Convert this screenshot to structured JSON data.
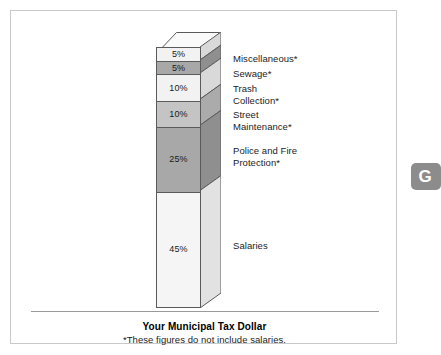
{
  "figure": {
    "caption_title": "Your Municipal Tax Dollar",
    "caption_note": "*These figures do not include salaries."
  },
  "badge": {
    "letter": "G"
  },
  "chart_data": {
    "type": "bar",
    "orientation": "vertical-stacked-3d",
    "title": "Your Municipal Tax Dollar",
    "subtitle": "*These figures do not include salaries.",
    "xlabel": "",
    "ylabel": "",
    "unit": "percent",
    "total": 100,
    "grid": false,
    "legend_position": "right-inline",
    "categories": [
      "Miscellaneous*",
      "Sewage*",
      "Trash Collection*",
      "Street Maintenance*",
      "Police and Fire Protection*",
      "Salaries"
    ],
    "values": [
      5,
      5,
      10,
      10,
      25,
      45
    ],
    "value_labels": [
      "5%",
      "5%",
      "10%",
      "10%",
      "25%",
      "45%"
    ],
    "segments": [
      {
        "label": "Miscellaneous*",
        "label_lines": "Miscellaneous*",
        "value": 5,
        "value_label": "5%",
        "face_color": "#f2f2f2",
        "side_color": "#d9d9d9"
      },
      {
        "label": "Sewage*",
        "label_lines": "Sewage*",
        "value": 5,
        "value_label": "5%",
        "face_color": "#a8a8a8",
        "side_color": "#8f8f8f"
      },
      {
        "label": "Trash Collection*",
        "label_lines": "Trash\nCollection*",
        "value": 10,
        "value_label": "10%",
        "face_color": "#f2f2f2",
        "side_color": "#d9d9d9"
      },
      {
        "label": "Street Maintenance*",
        "label_lines": "Street\nMaintenance*",
        "value": 10,
        "value_label": "10%",
        "face_color": "#c4c4c4",
        "side_color": "#ababab"
      },
      {
        "label": "Police and Fire Protection*",
        "label_lines": "Police and Fire\nProtection*",
        "value": 25,
        "value_label": "25%",
        "face_color": "#a8a8a8",
        "side_color": "#8f8f8f"
      },
      {
        "label": "Salaries",
        "label_lines": "Salaries",
        "value": 45,
        "value_label": "45%",
        "face_color": "#f5f5f5",
        "side_color": "#e2e2e2"
      }
    ]
  }
}
